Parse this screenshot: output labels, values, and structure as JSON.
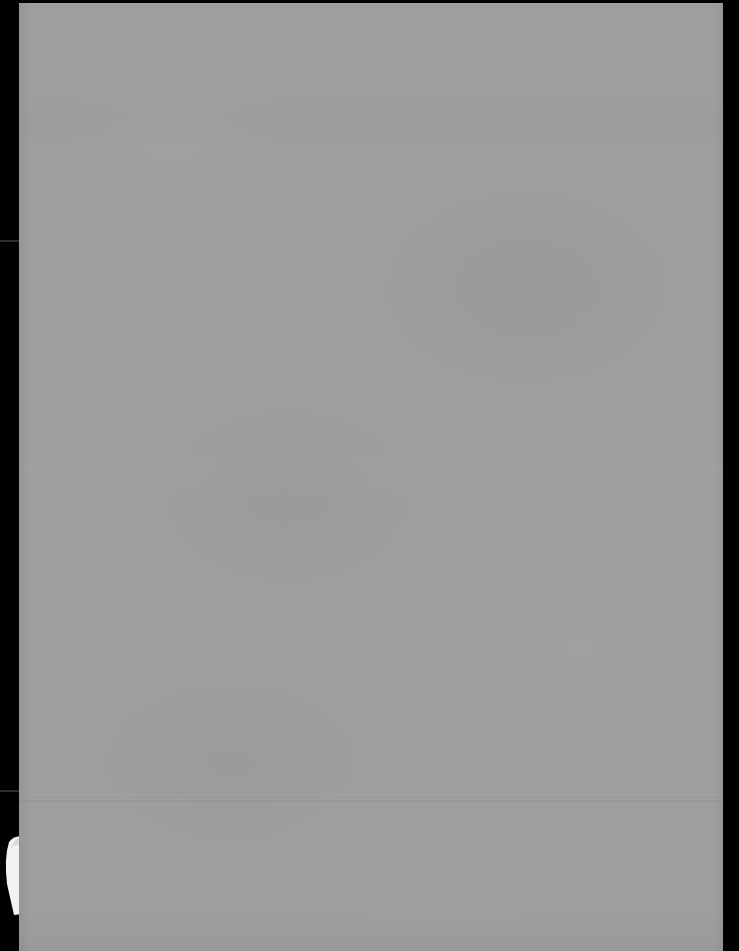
{
  "document": {
    "kind": "scanned-page-image",
    "page_state": "blank",
    "visible_text": "",
    "width_px": 739,
    "height_px": 951
  },
  "colors": {
    "scan_background": "#010101",
    "page_paper": "#9e9e9e",
    "underlying_sheet": "#f2f2f0",
    "margin_tick": "#2e2e2e"
  },
  "page": {
    "left_px": 19,
    "top_px": 3,
    "width_px": 704,
    "height_px": 948
  },
  "artifacts": {
    "crease": {
      "name": "horizontal-crease",
      "y_px": 799
    },
    "underlying_corner": {
      "name": "underlying-sheet-corner",
      "position": "bottom-left",
      "top_px": 836,
      "height_px": 80,
      "width_px": 22
    },
    "margin_ticks": [
      {
        "name": "margin-tick-upper",
        "y_px": 240
      },
      {
        "name": "margin-tick-lower",
        "y_px": 790
      }
    ]
  },
  "labels": {
    "page_description": "Blank scanned page"
  }
}
